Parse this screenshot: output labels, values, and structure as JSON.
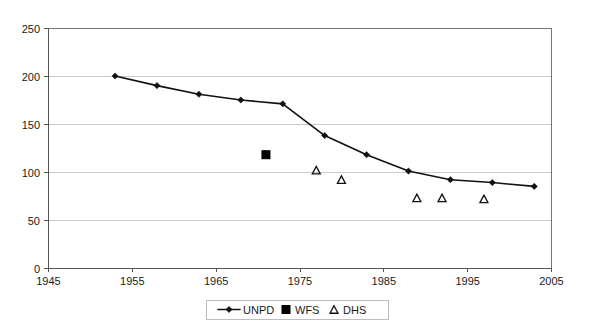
{
  "chart_data": {
    "type": "line",
    "title": "",
    "subtitle": "",
    "xlabel": "",
    "ylabel": "",
    "xlim": [
      1945,
      2005
    ],
    "ylim": [
      0,
      250
    ],
    "xticks": [
      1945,
      1955,
      1965,
      1975,
      1985,
      1995,
      2005
    ],
    "yticks": [
      0,
      50,
      100,
      150,
      200,
      250
    ],
    "xtick_labels": [
      "1945",
      "1955",
      "1965",
      "1975",
      "1985",
      "1995",
      "2005"
    ],
    "ytick_labels": [
      "0",
      "50",
      "100",
      "150",
      "200",
      "250"
    ],
    "grid": "horizontal",
    "legend_position": "bottom-center",
    "series": [
      {
        "name": "UNPD",
        "marker": "diamond",
        "style": "line-with-markers",
        "color": "#111111",
        "x": [
          1953,
          1958,
          1963,
          1968,
          1973,
          1978,
          1983,
          1988,
          1993,
          1998,
          2003
        ],
        "values": [
          200,
          190,
          181,
          175,
          171,
          138,
          118,
          101,
          92,
          89,
          85
        ]
      },
      {
        "name": "WFS",
        "marker": "filled-square",
        "style": "markers-only",
        "color": "#000000",
        "x": [
          1971
        ],
        "values": [
          118
        ]
      },
      {
        "name": "DHS",
        "marker": "open-triangle",
        "style": "markers-only",
        "color": "#111111",
        "x": [
          1977,
          1980,
          1989,
          1992,
          1997
        ],
        "values": [
          102,
          92,
          73,
          73,
          72
        ]
      }
    ]
  },
  "legend": {
    "entries": [
      {
        "label": "UNPD",
        "marker": "line-diamond-marker"
      },
      {
        "label": "WFS",
        "marker": "filled-square-marker"
      },
      {
        "label": "DHS",
        "marker": "open-triangle-marker"
      }
    ]
  },
  "colors": {
    "series_line": "#111111",
    "gridline": "#c9c9c9",
    "axis": "#555555",
    "plot_border": "#777777",
    "background": "#ffffff",
    "text": "#1a1a1a"
  }
}
